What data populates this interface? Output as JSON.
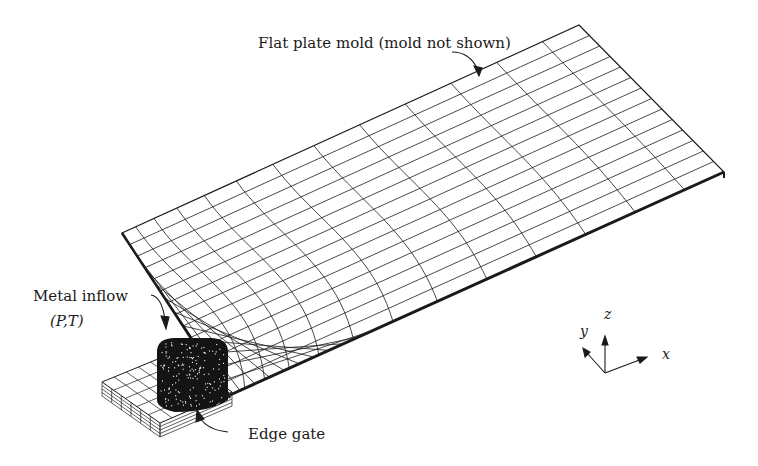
{
  "figure": {
    "labels": {
      "plate_mold": "Flat plate mold (mold not shown)",
      "metal_inflow": "Metal inflow",
      "inflow_vars": "(P,T)",
      "edge_gate": "Edge gate"
    },
    "axes": {
      "x": "x",
      "y": "y",
      "z": "z"
    },
    "colors": {
      "ink": "#1a1a1a",
      "background": "#ffffff"
    }
  }
}
